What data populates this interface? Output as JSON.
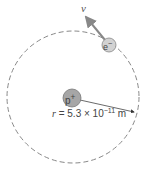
{
  "diagram": {
    "velocity_label": "v",
    "proton_label": "p",
    "proton_charge": "+",
    "electron_label": "e",
    "electron_charge": "−",
    "radius_var": "r",
    "radius_eq": " = 5.3 × 10",
    "radius_exp": "−11",
    "radius_unit": " m",
    "colors": {
      "orbit": "#888888",
      "proton_fill": "#a6a6a6",
      "electron_fill": "#d2d2d2",
      "arrow": "#888888",
      "radius_line": "#444444"
    }
  }
}
